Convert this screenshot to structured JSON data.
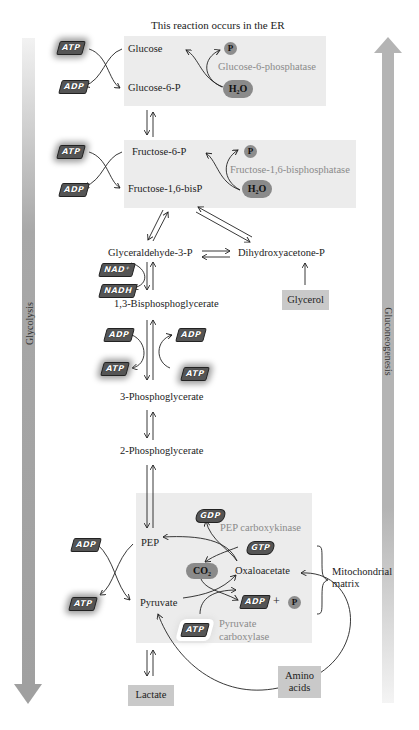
{
  "header": {
    "note": "This reaction occurs in the ER"
  },
  "side_arrows": {
    "left": {
      "label": "Glycolysis",
      "direction": "down",
      "color": "#a8a8a8"
    },
    "right": {
      "label": "Gluconeogenesis",
      "direction": "up",
      "color": "#b4b4b4"
    }
  },
  "metabolites": {
    "glucose": "Glucose",
    "glucose6p": "Glucose-6-P",
    "fructose6p": "Fructose-6-P",
    "fructose16bisp": "Fructose-1,6-bisP",
    "glyceraldehyde3p": "Glyceraldehyde-3-P",
    "dhap": "Dihydroxyacetone-P",
    "bpg13": "1,3-Bisphosphoglycerate",
    "pg3": "3-Phosphoglycerate",
    "pg2": "2-Phosphoglycerate",
    "pep": "PEP",
    "oxaloacetate": "Oxaloacetate",
    "pyruvate": "Pyruvate"
  },
  "enzymes": {
    "g6pase": "Glucose-6-phosphatase",
    "fbpase": "Fructose-1,6-bisphosphatase",
    "pepck": "PEP carboxykinase",
    "pc_line1": "Pyruvate",
    "pc_line2": "carboxylase"
  },
  "boxes": {
    "glycerol": "Glycerol",
    "lactate": "Lactate",
    "amino_line1": "Amino",
    "amino_line2": "acids"
  },
  "compartment": {
    "line1": "Mitochondrial",
    "line2": "matrix"
  },
  "cofactors": {
    "atp": "ATP",
    "adp": "ADP",
    "nad": "NAD⁺",
    "nadh": "NADH",
    "gtp": "GTP",
    "gdp": "GDP",
    "pi": "P",
    "h2o": "H₂O",
    "co2": "CO₂",
    "plus": "+"
  },
  "colors": {
    "shade": "#ececec",
    "box": "#c9c9c9",
    "enzyme_text": "#8a8a8a",
    "blob": "#8a8a8a"
  }
}
